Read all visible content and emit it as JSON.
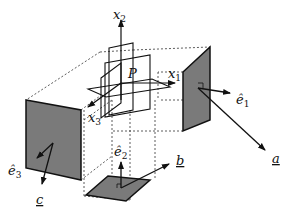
{
  "diagram": {
    "point": {
      "label": "P"
    },
    "axes": [
      {
        "name": "x",
        "sub": "1"
      },
      {
        "name": "x",
        "sub": "2"
      },
      {
        "name": "x",
        "sub": "3"
      }
    ],
    "unit_vectors": [
      {
        "name": "ê",
        "sub": "1"
      },
      {
        "name": "ê",
        "sub": "2"
      },
      {
        "name": "ê",
        "sub": "3"
      }
    ],
    "vectors": [
      {
        "label": "a",
        "underline": true,
        "face": "right"
      },
      {
        "label": "b",
        "underline": true,
        "face": "bottom"
      },
      {
        "label": "c",
        "underline": true,
        "face": "left"
      }
    ],
    "colors": {
      "face_fill": "#7a7a7a",
      "line": "#111111",
      "dashed": "#333333"
    }
  }
}
